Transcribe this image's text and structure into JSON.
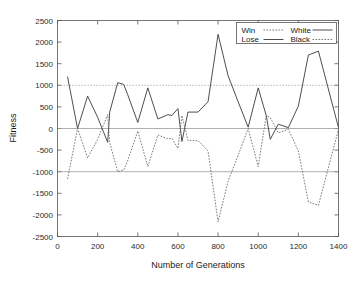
{
  "chart_data": {
    "type": "line",
    "title": "",
    "xlabel": "Number of Generations",
    "ylabel": "Fitness",
    "xlim": [
      0,
      1400
    ],
    "ylim": [
      -2500,
      2500
    ],
    "xticks": [
      0,
      200,
      400,
      600,
      800,
      1000,
      1200,
      1400
    ],
    "yticks": [
      -2500,
      -2000,
      -1500,
      -1000,
      -500,
      0,
      500,
      1000,
      1500,
      2000,
      2500
    ],
    "xtick_labels": [
      "0",
      "200",
      "400",
      "600",
      "800",
      "1000",
      "1200",
      "1400"
    ],
    "ytick_labels": [
      "-2500",
      "-2000",
      "-1500",
      "-1000",
      "-500",
      "0",
      "500",
      "1000",
      "1500",
      "2000",
      "2500"
    ],
    "grid": false,
    "legend_position": "top-right",
    "legend": [
      {
        "label": "Win",
        "style": "dotted",
        "column": 0,
        "row": 0
      },
      {
        "label": "White",
        "style": "solid",
        "column": 1,
        "row": 0
      },
      {
        "label": "Lose",
        "style": "solid",
        "column": 0,
        "row": 1
      },
      {
        "label": "Black",
        "style": "dotted",
        "column": 1,
        "row": 1
      }
    ],
    "reference_lines": [
      {
        "name": "Win",
        "value": 1000,
        "style": "dotted"
      },
      {
        "name": "Draw",
        "value": 0,
        "style": "solid"
      },
      {
        "name": "Lose",
        "value": -1000,
        "style": "solid"
      }
    ],
    "series": [
      {
        "name": "White",
        "style": "solid",
        "x": [
          50,
          100,
          150,
          200,
          250,
          260,
          300,
          330,
          350,
          400,
          450,
          500,
          550,
          570,
          600,
          620,
          650,
          700,
          750,
          800,
          850,
          900,
          950,
          1000,
          1040,
          1060,
          1100,
          1150,
          1200,
          1250,
          1300,
          1400
        ],
        "y": [
          1200,
          0,
          750,
          260,
          -320,
          380,
          1060,
          1020,
          780,
          140,
          940,
          220,
          320,
          300,
          460,
          -300,
          380,
          380,
          620,
          2180,
          1220,
          620,
          30,
          940,
          300,
          -250,
          100,
          20,
          520,
          1700,
          1790,
          20
        ]
      },
      {
        "name": "Black",
        "style": "dotted",
        "x": [
          50,
          100,
          150,
          200,
          250,
          260,
          300,
          330,
          350,
          400,
          450,
          500,
          550,
          570,
          600,
          620,
          650,
          700,
          750,
          800,
          850,
          900,
          950,
          1000,
          1040,
          1060,
          1100,
          1150,
          1200,
          1250,
          1300,
          1400
        ],
        "y": [
          -1170,
          0,
          -680,
          -250,
          320,
          -330,
          -1000,
          -960,
          -740,
          -60,
          -880,
          -150,
          -240,
          -230,
          -460,
          300,
          -280,
          -280,
          -520,
          -2160,
          -1220,
          -620,
          0,
          -880,
          300,
          250,
          -100,
          -20,
          -520,
          -1700,
          -1780,
          -20
        ]
      }
    ]
  },
  "axes": {
    "xlabel": "Number of Generations",
    "ylabel": "Fitness"
  }
}
